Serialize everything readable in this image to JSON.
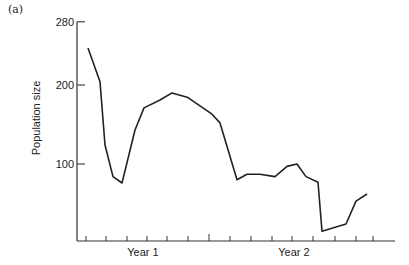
{
  "panel_label": "(a)",
  "chart_data": {
    "type": "line",
    "title": "",
    "panel": "(a)",
    "xlabel": "",
    "ylabel": "Population size",
    "x_tick_labels": [
      "Year 1",
      "Year 2"
    ],
    "y_ticks": [
      100,
      200,
      280
    ],
    "ylim": [
      0,
      280
    ],
    "grid": false,
    "legend": null,
    "x_minor_ticks_per_year": 8,
    "series": [
      {
        "name": "Population size",
        "x_px": [
          88,
          100,
          105,
          113,
          122,
          135,
          144,
          160,
          172,
          188,
          212,
          220,
          237,
          247,
          260,
          275,
          287,
          297,
          306,
          318,
          322,
          346,
          356,
          367
        ],
        "values": [
          247,
          204,
          124,
          84,
          76,
          143,
          171,
          181,
          190,
          184,
          163,
          152,
          80,
          87,
          87,
          84,
          97,
          100,
          84,
          77,
          15,
          24,
          53,
          62
        ]
      }
    ]
  },
  "axis": {
    "y_tick_labels": [
      "280",
      "200",
      "100"
    ],
    "x_labels": [
      "Year 1",
      "Year 2"
    ]
  }
}
